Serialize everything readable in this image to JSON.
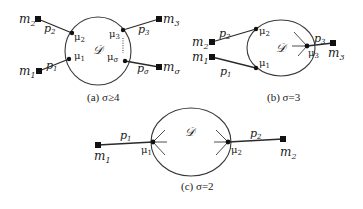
{
  "diagram": {
    "panels": [
      {
        "id": "a",
        "caption": "(a) σ≥4",
        "region_label": "𝒟",
        "nodes": [
          {
            "id": "m2",
            "label": "m",
            "sub": "2",
            "kind": "square"
          },
          {
            "id": "m1",
            "label": "m",
            "sub": "1",
            "kind": "square"
          },
          {
            "id": "m3",
            "label": "m",
            "sub": "3",
            "kind": "square"
          },
          {
            "id": "msigma",
            "label": "m",
            "sub": "σ",
            "kind": "square"
          },
          {
            "id": "mu2",
            "label": "μ",
            "sub": "2",
            "kind": "dot"
          },
          {
            "id": "mu1",
            "label": "μ",
            "sub": "1",
            "kind": "dot"
          },
          {
            "id": "mu3",
            "label": "μ",
            "sub": "3",
            "kind": "dot"
          },
          {
            "id": "musigma",
            "label": "μ",
            "sub": "σ",
            "kind": "dot"
          }
        ],
        "edges": [
          {
            "label": "p",
            "sub": "2",
            "from": "m2",
            "to": "mu2"
          },
          {
            "label": "p",
            "sub": "1",
            "from": "m1",
            "to": "mu1"
          },
          {
            "label": "p",
            "sub": "3",
            "from": "mu3",
            "to": "m3"
          },
          {
            "label": "p",
            "sub": "σ",
            "from": "musigma",
            "to": "msigma"
          }
        ]
      },
      {
        "id": "b",
        "caption": "(b) σ=3",
        "region_label": "𝒟",
        "nodes": [
          {
            "id": "m2",
            "label": "m",
            "sub": "2",
            "kind": "square"
          },
          {
            "id": "m1",
            "label": "m",
            "sub": "1",
            "kind": "square"
          },
          {
            "id": "m3",
            "label": "m",
            "sub": "3",
            "kind": "square"
          },
          {
            "id": "mu2",
            "label": "μ",
            "sub": "2",
            "kind": "dot"
          },
          {
            "id": "mu1",
            "label": "μ",
            "sub": "1",
            "kind": "dot"
          },
          {
            "id": "mu3",
            "label": "μ",
            "sub": "3",
            "kind": "dot"
          }
        ],
        "edges": [
          {
            "label": "p",
            "sub": "2",
            "from": "m2",
            "to": "mu2"
          },
          {
            "label": "p",
            "sub": "1",
            "from": "m1",
            "to": "mu1"
          },
          {
            "label": "p",
            "sub": "3",
            "from": "mu3",
            "to": "m3"
          }
        ]
      },
      {
        "id": "c",
        "caption": "(c) σ=2",
        "region_label": "𝒟",
        "nodes": [
          {
            "id": "m1",
            "label": "m",
            "sub": "1",
            "kind": "square"
          },
          {
            "id": "m2",
            "label": "m",
            "sub": "2",
            "kind": "square"
          },
          {
            "id": "mu1",
            "label": "μ",
            "sub": "1",
            "kind": "dot"
          },
          {
            "id": "mu2",
            "label": "μ",
            "sub": "2",
            "kind": "dot"
          }
        ],
        "edges": [
          {
            "label": "p",
            "sub": "1",
            "from": "m1",
            "to": "mu1"
          },
          {
            "label": "p",
            "sub": "2",
            "from": "mu2",
            "to": "m2"
          }
        ]
      }
    ]
  }
}
